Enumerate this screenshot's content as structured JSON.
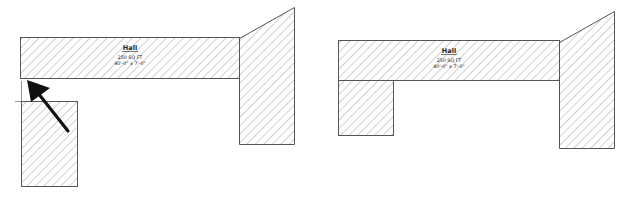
{
  "diagram": {
    "type": "floor-plan-comparison",
    "panels": [
      {
        "id": "before",
        "room_label": {
          "name": "Hall",
          "area": "250 SQ FT",
          "dimensions": "40'-0\" x 7'-0\""
        },
        "annotation": "arrow pointing to gap between hall and lower room"
      },
      {
        "id": "after",
        "room_label": {
          "name": "Hall",
          "area": "250 SQ FT",
          "dimensions": "40'-0\" x 7'-0\""
        }
      }
    ],
    "colors": {
      "stroke": "#555555",
      "hatch": "#8a8a8a",
      "arrow": "#111111",
      "background": "#ffffff"
    }
  }
}
